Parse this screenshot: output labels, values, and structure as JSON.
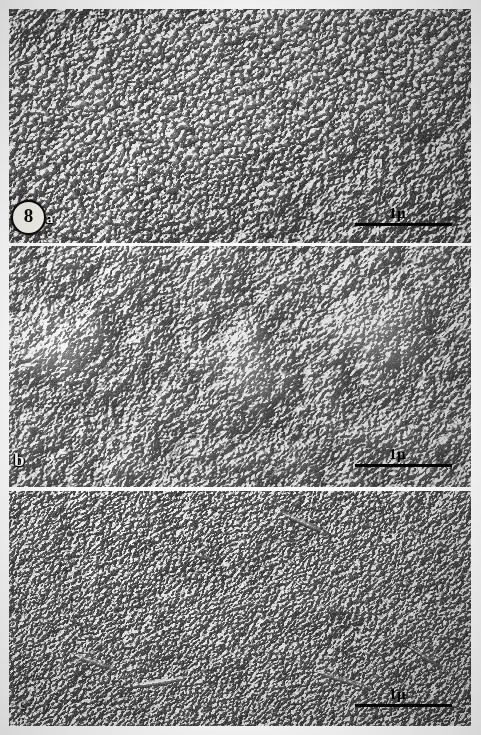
{
  "figure": {
    "number": "8",
    "panels": [
      {
        "id": "a",
        "label": "a",
        "scalebar_caption": "1μ",
        "description": "dense granular particle-studded fracture face"
      },
      {
        "id": "b",
        "label": "b",
        "scalebar_caption": "1μ",
        "description": "smooth fracture face with three raised dome-like blisters"
      },
      {
        "id": "c",
        "label": "c",
        "scalebar_caption": "1μ",
        "description": "fine granular fracture face with elongate ridge features"
      }
    ]
  }
}
